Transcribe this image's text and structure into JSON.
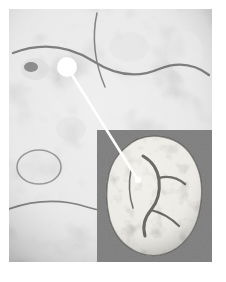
{
  "page": {
    "background_color": "#ffffff",
    "width": 226,
    "height": 282
  },
  "figure": {
    "type": "sem-micrograph",
    "modality": "grayscale electron micrograph",
    "bounds": {
      "x": 9,
      "y": 9,
      "width": 203,
      "height": 253
    },
    "tone": {
      "background": "#8a8a8a",
      "highlight": "#f2f2f2",
      "midtone": "#9c9c9c",
      "shadow": "#2a2a2a"
    }
  },
  "inset": {
    "label": "inset-panel",
    "description": "Lower-magnification inset showing a single rounded aggregate particle with a rough, cauliflower-like surface, set on a flat gray background.",
    "bounds": {
      "x": 97,
      "y": 130,
      "width": 115,
      "height": 132
    },
    "background_color": "#7e7e7e",
    "particle_tone": {
      "highlight": "#e8e6e0",
      "midtone": "#b5b1a8",
      "shadow": "#3a3a38"
    }
  },
  "annotation": {
    "marker": {
      "name": "region-of-interest-marker",
      "shape": "filled-circle",
      "color": "#ffffff",
      "center_x": 67,
      "center_y": 67,
      "radius": 10
    },
    "leader_line": {
      "name": "leader-line",
      "color": "#ffffff",
      "width": 2.4,
      "from_x": 67,
      "from_y": 67,
      "to_x": 138,
      "to_y": 180
    },
    "endpoint": {
      "name": "leader-line-endpoint",
      "shape": "filled-circle",
      "color": "#ffffff",
      "center_x": 138,
      "center_y": 180,
      "radius": 3.2
    }
  },
  "caption": {
    "text": ""
  }
}
